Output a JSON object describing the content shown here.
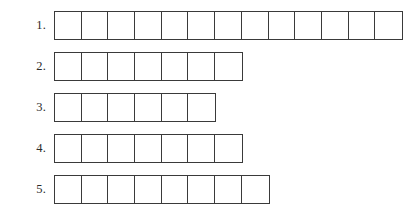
{
  "worksheet": {
    "title": "Numbered letter-box answer grid",
    "background_color": "#ffffff",
    "line_color": "#3a3a3a",
    "label_color": "#2b2b2b",
    "cell_width_px": 27,
    "cell_height_px": 29,
    "rows": [
      {
        "label": "1.",
        "cells": 13,
        "cell_values": [
          "",
          "",
          "",
          "",
          "",
          "",
          "",
          "",
          "",
          "",
          "",
          "",
          ""
        ]
      },
      {
        "label": "2.",
        "cells": 7,
        "cell_values": [
          "",
          "",
          "",
          "",
          "",
          "",
          ""
        ]
      },
      {
        "label": "3.",
        "cells": 6,
        "cell_values": [
          "",
          "",
          "",
          "",
          "",
          ""
        ]
      },
      {
        "label": "4.",
        "cells": 7,
        "cell_values": [
          "",
          "",
          "",
          "",
          "",
          "",
          ""
        ]
      },
      {
        "label": "5.",
        "cells": 8,
        "cell_values": [
          "",
          "",
          "",
          "",
          "",
          "",
          "",
          ""
        ]
      }
    ]
  }
}
